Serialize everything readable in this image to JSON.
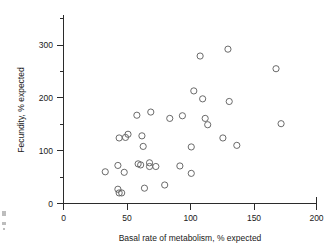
{
  "figure": {
    "background_color": "#ffffff",
    "marker_color": "#5a5a5a",
    "axis_color": "#2b2b2b"
  },
  "chart_data": {
    "type": "scatter",
    "title": "",
    "xlabel": "Basal rate of metabolism, % expected",
    "ylabel": "Fecundity, % expected",
    "xlim": [
      0,
      200
    ],
    "ylim": [
      0,
      350
    ],
    "grid": false,
    "legend": null,
    "x_major_ticks": [
      0,
      50,
      100,
      150,
      200
    ],
    "x_major_tick_labels": [
      "0",
      "50",
      "100",
      "150",
      "200"
    ],
    "x_minor_ticks": [
      25,
      75,
      125,
      175
    ],
    "y_major_ticks": [
      0,
      100,
      200,
      300
    ],
    "y_major_tick_labels": [
      "0",
      "100",
      "200",
      "300"
    ],
    "y_minor_ticks": [
      50,
      150,
      250,
      350
    ],
    "marker": "open-circle",
    "marker_size": 4,
    "n_points": 41,
    "points": [
      {
        "x": 33,
        "y": 60
      },
      {
        "x": 43,
        "y": 72
      },
      {
        "x": 44,
        "y": 124
      },
      {
        "x": 43,
        "y": 27
      },
      {
        "x": 44,
        "y": 20
      },
      {
        "x": 46,
        "y": 20
      },
      {
        "x": 48,
        "y": 59
      },
      {
        "x": 49,
        "y": 125
      },
      {
        "x": 51,
        "y": 131
      },
      {
        "x": 58,
        "y": 167
      },
      {
        "x": 59,
        "y": 75
      },
      {
        "x": 61,
        "y": 73
      },
      {
        "x": 62,
        "y": 128
      },
      {
        "x": 63,
        "y": 108
      },
      {
        "x": 64,
        "y": 29
      },
      {
        "x": 68,
        "y": 77
      },
      {
        "x": 68,
        "y": 70
      },
      {
        "x": 69,
        "y": 173
      },
      {
        "x": 73,
        "y": 70
      },
      {
        "x": 80,
        "y": 35
      },
      {
        "x": 84,
        "y": 161
      },
      {
        "x": 92,
        "y": 71
      },
      {
        "x": 94,
        "y": 166
      },
      {
        "x": 101,
        "y": 57
      },
      {
        "x": 101,
        "y": 107
      },
      {
        "x": 103,
        "y": 213
      },
      {
        "x": 108,
        "y": 279
      },
      {
        "x": 110,
        "y": 198
      },
      {
        "x": 112,
        "y": 161
      },
      {
        "x": 114,
        "y": 149
      },
      {
        "x": 126,
        "y": 124
      },
      {
        "x": 130,
        "y": 292
      },
      {
        "x": 131,
        "y": 193
      },
      {
        "x": 137,
        "y": 110
      },
      {
        "x": 168,
        "y": 255
      },
      {
        "x": 172,
        "y": 151
      }
    ]
  }
}
